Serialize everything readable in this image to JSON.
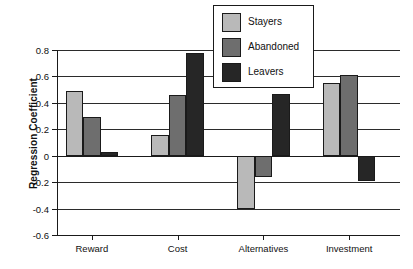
{
  "chart_data": {
    "type": "bar",
    "title": "",
    "xlabel": "",
    "ylabel": "Regression Coefficient",
    "categories": [
      "Reward",
      "Cost",
      "Alternatives",
      "Investment"
    ],
    "series": [
      {
        "name": "Stayers",
        "color": "#b9b9b9",
        "values": [
          0.49,
          0.16,
          -0.4,
          0.55
        ]
      },
      {
        "name": "Abandoned",
        "color": "#6e6e6e",
        "values": [
          0.29,
          0.46,
          -0.16,
          0.61
        ]
      },
      {
        "name": "Leavers",
        "color": "#262626",
        "values": [
          0.03,
          0.78,
          0.47,
          -0.19
        ]
      }
    ],
    "ylim": [
      -0.6,
      0.8
    ],
    "yticks": [
      0.8,
      0.6,
      0.4,
      0.2,
      0,
      -0.2,
      -0.4,
      -0.6
    ],
    "ytick_labels": [
      "0.8",
      "0.6",
      "0.4",
      "0.2",
      "0",
      "-0.2",
      "-0.4",
      "-0.6"
    ],
    "grid": true,
    "grid_axis": "y",
    "legend_position": "top-right",
    "legend_entries": [
      "Stayers",
      "Abandoned",
      "Leavers"
    ]
  }
}
